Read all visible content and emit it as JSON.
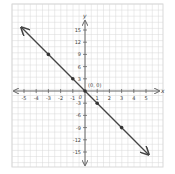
{
  "chart_data": {
    "type": "line",
    "title": "",
    "xlabel": "x",
    "ylabel": "y",
    "xlim": [
      -5,
      5
    ],
    "ylim": [
      -15,
      15
    ],
    "grid": true,
    "x_ticks": [
      -5,
      -4,
      -3,
      -2,
      -1,
      1,
      2,
      3,
      4,
      5
    ],
    "x_tick_labels": [
      "-5",
      "-4",
      "-3",
      "-2",
      "-1",
      "1",
      "2",
      "3",
      "4",
      "5"
    ],
    "y_ticks": [
      15,
      12,
      9,
      6,
      3,
      -3,
      -6,
      -9,
      -12,
      -15
    ],
    "y_tick_labels": [
      "15",
      "12",
      "9",
      "6",
      "3",
      "-3",
      "-6",
      "-9",
      "-12",
      "-15"
    ],
    "origin_label": "0",
    "annotations": [
      {
        "text": "(0, 0)",
        "x": 0,
        "y": 0
      }
    ],
    "series": [
      {
        "name": "y = -3x",
        "equation": "y = -3x",
        "line_endpoints": [
          {
            "x": -5.2,
            "y": 15.6
          },
          {
            "x": 5.2,
            "y": -15.6
          }
        ],
        "arrows": "both",
        "points": [
          {
            "x": -3,
            "y": 9
          },
          {
            "x": -1,
            "y": 3
          },
          {
            "x": 0,
            "y": 0
          },
          {
            "x": 1,
            "y": -3
          },
          {
            "x": 3,
            "y": -9
          }
        ]
      }
    ]
  },
  "colors": {
    "grid": "#d9d9d9",
    "axis": "#666666",
    "line": "#444444",
    "point": "#333333"
  }
}
